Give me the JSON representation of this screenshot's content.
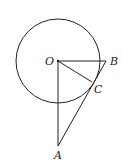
{
  "diagram": {
    "points": {
      "O": {
        "label": "O",
        "x": 58,
        "y": 61
      },
      "B": {
        "label": "B",
        "x": 106,
        "y": 61
      },
      "C": {
        "label": "C",
        "x": 92,
        "y": 82
      },
      "A": {
        "label": "A",
        "x": 58,
        "y": 146
      }
    },
    "circle": {
      "center": "O",
      "radius": 42
    },
    "segments": [
      "OB",
      "OC",
      "OA",
      "AB"
    ],
    "stroke_color": "#222222"
  }
}
